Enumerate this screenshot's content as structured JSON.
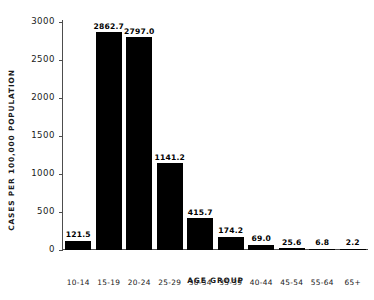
{
  "chart_data": {
    "type": "bar",
    "title": "",
    "xlabel": "AGE GROUP",
    "ylabel": "CASES PER 100,000 POPULATION",
    "categories": [
      "10-14",
      "15-19",
      "20-24",
      "25-29",
      "30-34",
      "35-39",
      "40-44",
      "45-54",
      "55-64",
      "65+"
    ],
    "values": [
      121.5,
      2862.7,
      2797.0,
      1141.2,
      415.7,
      174.2,
      69.0,
      25.6,
      6.8,
      2.2
    ],
    "value_labels": [
      "121.5",
      "2862.7",
      "2797.0",
      "1141.2",
      "415.7",
      "174.2",
      "69.0",
      "25.6",
      "6.8",
      "2.2"
    ],
    "ylim": [
      0,
      3000
    ],
    "yticks": [
      0,
      500,
      1000,
      1500,
      2000,
      2500,
      3000
    ],
    "ytick_labels": [
      "0",
      "500",
      "1000",
      "1500",
      "2000",
      "2500",
      "3000"
    ],
    "grid": false,
    "legend": "none",
    "bar_color": "#000000",
    "axis_color": "#4d4d4d",
    "background_color": "#ffffff"
  }
}
